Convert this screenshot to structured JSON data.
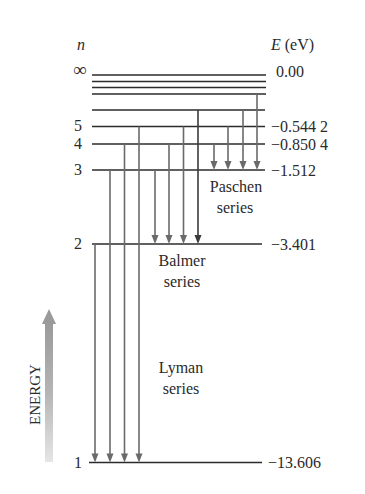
{
  "figure": {
    "n_axis_label": "n",
    "energy_axis_label_symbol": "E",
    "energy_axis_label_unit": " (eV)",
    "energy_arrow_label": "ENERGY",
    "series_labels": {
      "paschen_line1": "Paschen",
      "paschen_line2": "series",
      "balmer_line1": "Balmer",
      "balmer_line2": "series",
      "lyman_line1": "Lyman",
      "lyman_line2": "series"
    },
    "levels": [
      {
        "n": "∞",
        "energy": "0.00"
      },
      {
        "n": "5",
        "energy": "−0.544 2"
      },
      {
        "n": "4",
        "energy": "−0.850 4"
      },
      {
        "n": "3",
        "energy": "−1.512"
      },
      {
        "n": "2",
        "energy": "−3.401"
      },
      {
        "n": "1",
        "energy": "−13.606"
      }
    ]
  },
  "chart_data": {
    "type": "energy-level-diagram",
    "xlabel": "n",
    "ylabel": "E (eV)",
    "levels": [
      {
        "n": "inf",
        "E_eV": 0.0
      },
      {
        "n": 5,
        "E_eV": -0.5442
      },
      {
        "n": 4,
        "E_eV": -0.8504
      },
      {
        "n": 3,
        "E_eV": -1.512
      },
      {
        "n": 2,
        "E_eV": -3.401
      },
      {
        "n": 1,
        "E_eV": -13.606
      }
    ],
    "unlabeled_levels_drawn": [
      6,
      7,
      8,
      9
    ],
    "series": [
      {
        "name": "Lyman series",
        "final_n": 1,
        "initial_n": [
          2,
          3,
          4,
          5
        ]
      },
      {
        "name": "Balmer series",
        "final_n": 2,
        "initial_n": [
          3,
          4,
          5,
          6
        ]
      },
      {
        "name": "Paschen series",
        "final_n": 3,
        "initial_n": [
          4,
          5,
          6,
          7
        ]
      }
    ],
    "annotations": [
      "ENERGY (upward arrow)"
    ]
  }
}
